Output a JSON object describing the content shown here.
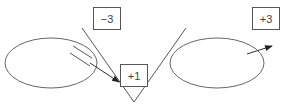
{
  "diagram": {
    "boxes": [
      {
        "id": "minus3",
        "label": "−3"
      },
      {
        "id": "plus1",
        "label": "+1"
      },
      {
        "id": "plus3",
        "label": "+3"
      }
    ],
    "colors": {
      "stroke": "#555555",
      "text": "#444444",
      "background": "#ffffff"
    }
  }
}
